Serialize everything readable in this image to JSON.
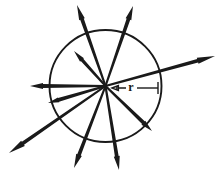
{
  "figure": {
    "background_color": "#ffffff",
    "ink_color": "#1a1a1a",
    "circle": {
      "center_x": 105.5,
      "center_y": 86.0,
      "radius": 56.0,
      "stroke_color": "#1a1a1a",
      "stroke_width": 1.9
    },
    "radius_annotation": {
      "label": "r",
      "label_x": 131,
      "label_y": 88,
      "font_size": 12,
      "color": "#1a1a1a",
      "leader_left_x1": 112,
      "leader_left_x2": 126,
      "leader_right_x1": 137,
      "leader_right_x2": 158,
      "leader_y": 88,
      "arrow_head_size": 4.0
    },
    "vectors": [
      {
        "name": "vector-west",
        "angle_deg": 180,
        "tip_x": 30,
        "tip_y": 86,
        "length": 75.5,
        "half_width": 1.9,
        "arrow_head_length": 13,
        "arrow_head_half_width": 3.0
      },
      {
        "name": "vector-northwest-long",
        "angle_deg": 118,
        "tip_x": 77,
        "tip_y": 5,
        "length": 84.0,
        "half_width": 1.9,
        "arrow_head_length": 15,
        "arrow_head_half_width": 3.0
      },
      {
        "name": "vector-north-northeast",
        "angle_deg": 71,
        "tip_x": 133,
        "tip_y": 6,
        "length": 84.5,
        "half_width": 1.9,
        "arrow_head_length": 14,
        "arrow_head_half_width": 3.0
      },
      {
        "name": "vector-east-northeast",
        "angle_deg": 22,
        "tip_x": 215,
        "tip_y": 56,
        "length": 117.0,
        "half_width": 1.9,
        "arrow_head_length": 18,
        "arrow_head_half_width": 3.2
      },
      {
        "name": "vector-southeast",
        "angle_deg": -44,
        "tip_x": 152,
        "tip_y": 131,
        "length": 65.0,
        "half_width": 1.9,
        "arrow_head_length": 12,
        "arrow_head_half_width": 2.8
      },
      {
        "name": "vector-south-southeast",
        "angle_deg": -70,
        "tip_x": 119,
        "tip_y": 170,
        "length": 89.0,
        "half_width": 1.9,
        "arrow_head_length": 14,
        "arrow_head_half_width": 3.0
      },
      {
        "name": "vector-south-southwest",
        "angle_deg": -104,
        "tip_x": 74,
        "tip_y": 168,
        "length": 85.0,
        "half_width": 1.9,
        "arrow_head_length": 14,
        "arrow_head_half_width": 3.0
      },
      {
        "name": "vector-southwest-long",
        "angle_deg": -147,
        "tip_x": 9,
        "tip_y": 153,
        "length": 115.0,
        "half_width": 1.9,
        "arrow_head_length": 17,
        "arrow_head_half_width": 3.2
      },
      {
        "name": "vector-west-southwest",
        "angle_deg": -163,
        "tip_x": 48,
        "tip_y": 103,
        "length": 59.5,
        "half_width": 1.9,
        "arrow_head_length": 11,
        "arrow_head_half_width": 2.6
      },
      {
        "name": "vector-northwest-short",
        "angle_deg": 132,
        "tip_x": 74,
        "tip_y": 51,
        "length": 46.5,
        "half_width": 1.7,
        "arrow_head_length": 12,
        "arrow_head_half_width": 2.6
      }
    ]
  }
}
